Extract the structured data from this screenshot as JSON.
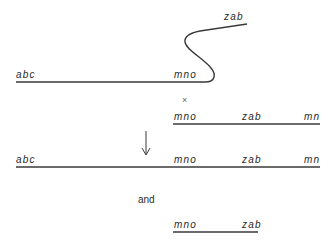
{
  "diagram": {
    "top": {
      "strand_a": {
        "left_label": "abc",
        "right_label": "mno"
      },
      "strand_b_end_label": "zab"
    },
    "cross_symbol": "×",
    "second_strand": {
      "labels": [
        "mno",
        "zab",
        "mn"
      ]
    },
    "arrow": "down-arrow",
    "result_strand": {
      "labels": [
        "abc",
        "mno",
        "zab",
        "mn"
      ]
    },
    "conjunction": "and",
    "excised_fragment": {
      "labels": [
        "mno",
        "zab"
      ]
    }
  }
}
